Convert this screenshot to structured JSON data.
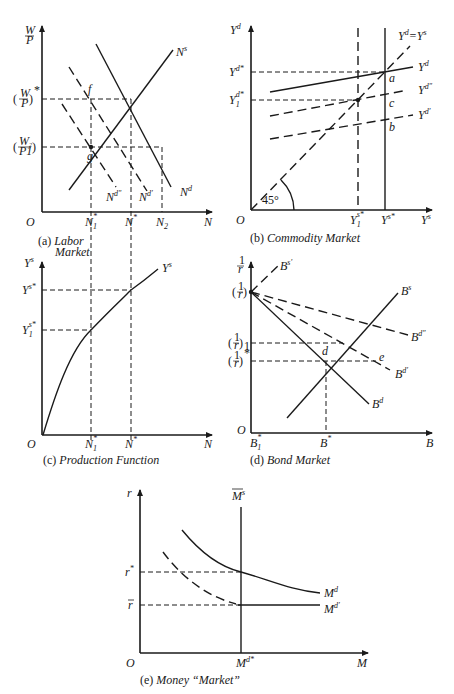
{
  "figure": {
    "panels": [
      {
        "id": "a",
        "caption_prefix": "(a)",
        "caption": "Labor Market",
        "y_axis_label": "W/P",
        "x_axis_label": "N",
        "origin_label": "O",
        "y_ticks": [
          "(W/P)*",
          "(W2/P1)"
        ],
        "x_ticks": [
          "N1*",
          "N*",
          "N2"
        ],
        "curves": [
          "Ns",
          "Nd",
          "Nd'",
          "Nd''"
        ],
        "points": [
          "f",
          "g"
        ]
      },
      {
        "id": "b",
        "caption_prefix": "(b)",
        "caption": "Commodity Market",
        "y_axis_label": "Yd",
        "x_axis_label": "Ys",
        "origin_label": "O",
        "y_ticks": [
          "Yd*",
          "Y1d*"
        ],
        "x_ticks": [
          "Y1s*",
          "Ys*"
        ],
        "curves": [
          "Yd = Ys",
          "Yd",
          "Yd''",
          "Yd'"
        ],
        "points": [
          "a",
          "c",
          "b"
        ],
        "angle_label": "45°"
      },
      {
        "id": "c",
        "caption_prefix": "(c)",
        "caption": "Production Function",
        "y_axis_label": "Ys",
        "x_axis_label": "N",
        "origin_label": "O",
        "y_ticks": [
          "Ys*",
          "Y1s*"
        ],
        "x_ticks": [
          "N1*",
          "N*"
        ],
        "curves": [
          "Ys"
        ]
      },
      {
        "id": "d",
        "caption_prefix": "(d)",
        "caption": "Bond Market",
        "y_axis_label": "1/r",
        "x_axis_label": "B",
        "origin_label": "O",
        "y_ticks": [
          "(1/r)",
          "(1/r)1",
          "(1/r)*"
        ],
        "x_ticks": [
          "B1*",
          "B*"
        ],
        "curves": [
          "Bs'",
          "Bs",
          "Bd''",
          "Bd'",
          "Bd"
        ],
        "points": [
          "d",
          "e"
        ]
      },
      {
        "id": "e",
        "caption_prefix": "(e)",
        "caption": "Money “Market”",
        "y_axis_label": "r",
        "x_axis_label": "M",
        "origin_label": "O",
        "y_ticks": [
          "r*",
          "r̄"
        ],
        "x_ticks": [
          "Md*"
        ],
        "curves": [
          "M̄s",
          "Md",
          "Md'"
        ]
      }
    ]
  },
  "labels": {
    "O": "O",
    "N": "N",
    "M": "M",
    "B": "B",
    "f": "f",
    "g": "g",
    "a": "a",
    "b": "b",
    "c": "c",
    "d": "d",
    "e": "e",
    "W": "W",
    "P": "P",
    "W2": "W",
    "P1": "P",
    "two": "2",
    "one": "1",
    "star": "*",
    "s": "s",
    "dsup": "d",
    "Y": "Y",
    "prime": "′",
    "dprime": "″",
    "eq": "=",
    "deg45": "45°",
    "lp": "(",
    "rp": ")",
    "r": "r",
    "rbar": "r",
    "one_over": "1",
    "cap_a_prefix": "(a)",
    "cap_a_1": "Labor",
    "cap_a_2": "Market",
    "cap_b_prefix": "(b)",
    "cap_b": "Commodity Market",
    "cap_c_prefix": "(c)",
    "cap_c": "Production Function",
    "cap_d_prefix": "(d)",
    "cap_d": "Bond Market",
    "cap_e_prefix": "(e)",
    "cap_e": "Money “Market”"
  }
}
